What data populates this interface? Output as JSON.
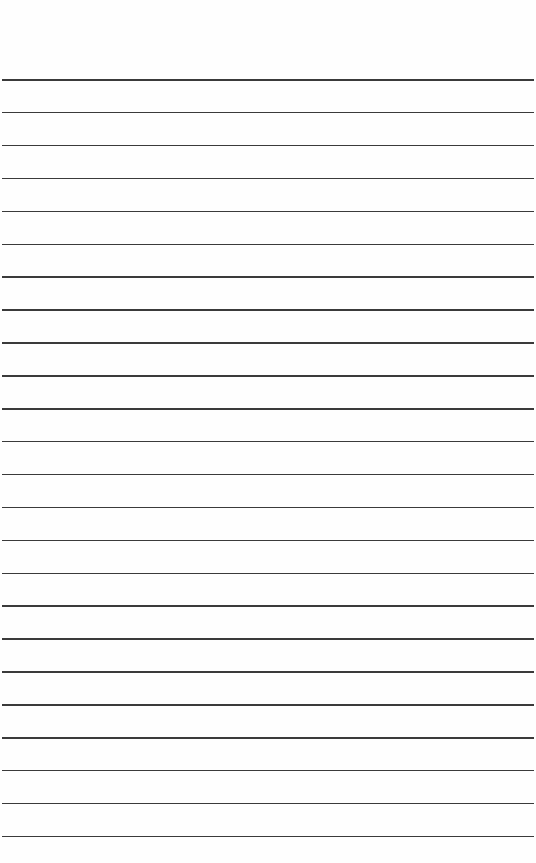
{
  "page": {
    "type": "lined-paper",
    "background_color": "#fefefe",
    "line_color": "#3a3a3a",
    "line_count": 24,
    "first_line_y": 79,
    "line_spacing": 32.9,
    "text": ""
  }
}
